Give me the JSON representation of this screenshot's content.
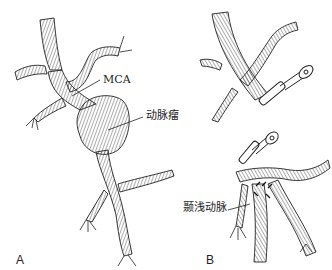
{
  "figure": {
    "panels": [
      {
        "id": "A",
        "label": "A"
      },
      {
        "id": "B",
        "label": "B"
      }
    ],
    "labels": {
      "mca": "MCA",
      "aneurysm": "动脉瘤",
      "sta": "颞浅动脉"
    },
    "colors": {
      "ink": "#222222",
      "background": "#ffffff"
    }
  }
}
